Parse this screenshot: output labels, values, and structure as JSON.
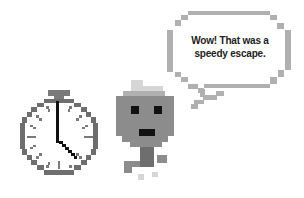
{
  "speech_bubble": {
    "lines": [
      "Wow! That was a",
      "speedy escape."
    ]
  },
  "stopwatch": {
    "hour_hand_points_to": 12,
    "minute_hand_points_to": 4
  },
  "colors": {
    "bubble_border": "#b0b0b0",
    "character_body": "#8c8c8c",
    "stopwatch_frame": "#6e6e6e",
    "hands": "#111111"
  }
}
